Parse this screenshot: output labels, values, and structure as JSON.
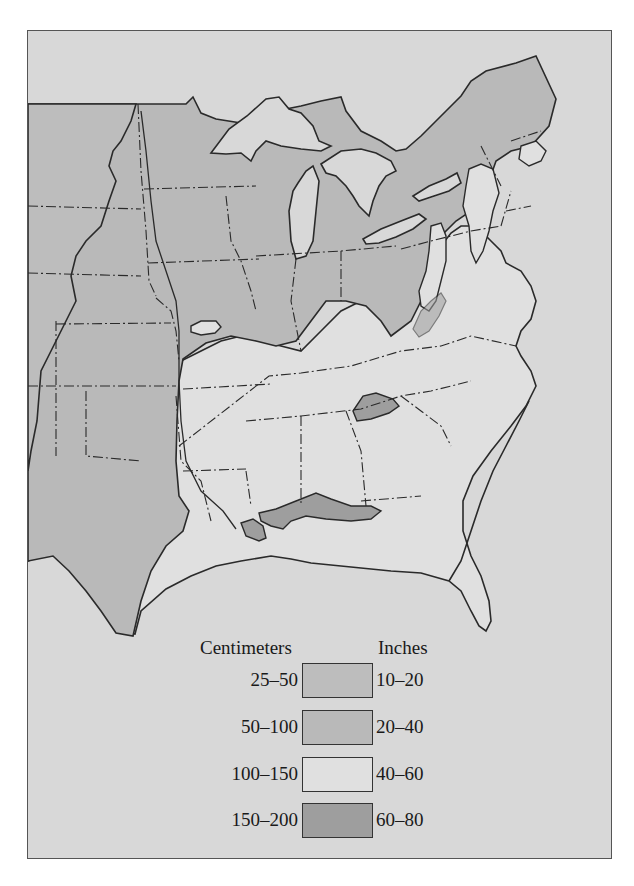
{
  "map": {
    "title": "Annual precipitation, eastern United States",
    "background_color": "#d8d8d8",
    "outline_color": "#2a2a2a"
  },
  "legend": {
    "cm_header": "Centimeters",
    "in_header": "Inches",
    "items": [
      {
        "cm": "25–50",
        "inches": "10–20",
        "color": "#bdbdbd"
      },
      {
        "cm": "50–100",
        "inches": "20–40",
        "color": "#b9b9b9"
      },
      {
        "cm": "100–150",
        "inches": "40–60",
        "color": "#e0e0e0"
      },
      {
        "cm": "150–200",
        "inches": "60–80",
        "color": "#9e9e9e"
      }
    ]
  },
  "regions": {
    "band_10_20_label": "10–20 in (westmost strip)",
    "band_20_40_label": "20–40 in (Midwest, Great Lakes, Northeast uplands, Texas)",
    "band_40_60_label": "40–60 in (Southeast, Mid-Atlantic)",
    "band_60_80_label": "60–80 in (Gulf coast, southern Appalachians)"
  }
}
